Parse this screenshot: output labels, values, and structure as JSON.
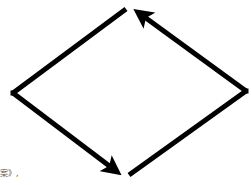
{
  "diagram": {
    "type": "cycle",
    "shape": "diamond",
    "stroke_color": "#000000",
    "background_color": "#ffffff",
    "segments": [
      {
        "id": "top-left",
        "from": [
          126,
          9
        ],
        "to": [
          13,
          93
        ],
        "arrow": false
      },
      {
        "id": "bottom-left",
        "from": [
          13,
          93
        ],
        "to": [
          124,
          177
        ],
        "arrow": true
      },
      {
        "id": "bottom-right",
        "from": [
          129,
          175
        ],
        "to": [
          246,
          91
        ],
        "arrow": false
      },
      {
        "id": "top-right",
        "from": [
          246,
          91
        ],
        "to": [
          131,
          7
        ],
        "arrow": true
      }
    ]
  },
  "caption": {
    "text": "案》,"
  }
}
